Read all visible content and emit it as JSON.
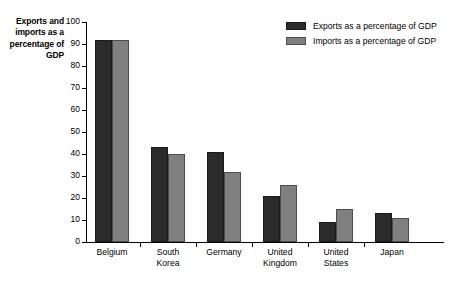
{
  "chart_data": {
    "type": "bar",
    "title": "",
    "xlabel": "",
    "ylabel": "Exports and imports as a percentage of GDP",
    "ylim": [
      0,
      100
    ],
    "grid": false,
    "legend_position": "top-right",
    "categories": [
      "Belgium",
      "South Korea",
      "Germany",
      "United Kingdom",
      "United States",
      "Japan"
    ],
    "category_lines": [
      [
        "Belgium"
      ],
      [
        "South",
        "Korea"
      ],
      [
        "Germany"
      ],
      [
        "United",
        "Kingdom"
      ],
      [
        "United",
        "States"
      ],
      [
        "Japan"
      ]
    ],
    "yticks": [
      100,
      90,
      80,
      70,
      60,
      50,
      40,
      30,
      20,
      10,
      0
    ],
    "series": [
      {
        "name": "Exports as a percentage of GDP",
        "color": "#2b2b2b",
        "values": [
          92,
          43,
          41,
          21,
          9,
          13
        ]
      },
      {
        "name": "Imports as a percentage of GDP",
        "color": "#808080",
        "values": [
          92,
          40,
          32,
          26,
          15,
          11
        ]
      }
    ]
  },
  "legend": {
    "items": [
      {
        "label": "Exports as a percentage of GDP"
      },
      {
        "label": "Imports as a percentage of GDP"
      }
    ]
  },
  "axis": {
    "y_title": "Exports and imports as a percentage of GDP"
  }
}
